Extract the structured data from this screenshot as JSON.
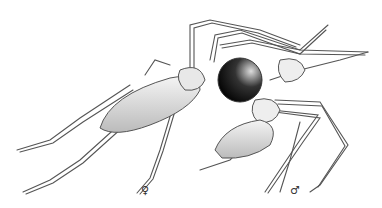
{
  "illustration": {
    "subject": "scientific line drawing of two spiders (female and male)",
    "labels": {
      "female": "♀",
      "male": "♂"
    },
    "colors": {
      "background": "#ffffff",
      "line": "#444444",
      "dark_abdomen": "#111111"
    }
  }
}
